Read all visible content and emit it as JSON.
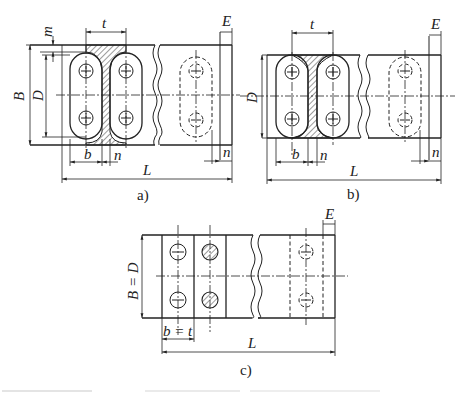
{
  "figure": {
    "panels": [
      {
        "id": "a",
        "caption": "a)",
        "labels": {
          "t": "t",
          "m": "m",
          "E": "E",
          "B": "B",
          "D": "D",
          "b": "b",
          "n1": "n",
          "n2": "n",
          "L": "L"
        }
      },
      {
        "id": "b",
        "caption": "b)",
        "labels": {
          "t": "t",
          "E": "E",
          "D": "D",
          "b": "b",
          "n1": "n",
          "n2": "n",
          "L": "L"
        }
      },
      {
        "id": "c",
        "caption": "c)",
        "labels": {
          "E": "E",
          "BD": "B = D",
          "bt": "b = t",
          "L": "L"
        }
      }
    ],
    "caption_partial": "Fig. (cut off, illegible)"
  },
  "colors": {
    "line": "#222222",
    "background": "#ffffff"
  }
}
